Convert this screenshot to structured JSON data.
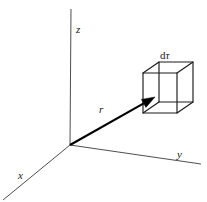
{
  "figure": {
    "background_color": "#ffffff",
    "line_color": "#3a3a3a",
    "vector_color": "#000000",
    "cube_color": "#1a1a1a",
    "width": 207,
    "height": 202
  },
  "axes": {
    "origin": {
      "x": 70,
      "y": 145
    },
    "items": [
      {
        "id": "z",
        "label": "z",
        "from": {
          "x": 71,
          "y": 9
        },
        "to": {
          "x": 70,
          "y": 145
        },
        "label_pos": {
          "x": 76,
          "y": 24
        }
      },
      {
        "id": "y",
        "label": "y",
        "from": {
          "x": 70,
          "y": 145
        },
        "to": {
          "x": 201,
          "y": 164
        },
        "label_pos": {
          "x": 177,
          "y": 149
        }
      },
      {
        "id": "x",
        "label": "x",
        "from": {
          "x": 70,
          "y": 145
        },
        "to": {
          "x": 3,
          "y": 200
        },
        "label_pos": {
          "x": 18,
          "y": 170
        }
      }
    ]
  },
  "vector": {
    "id": "r",
    "label": "r",
    "from": {
      "x": 70,
      "y": 145
    },
    "to": {
      "x": 155,
      "y": 97
    },
    "label_pos": {
      "x": 99,
      "y": 104
    },
    "has_arrowhead": true
  },
  "volume_element": {
    "id": "dtau",
    "label": "dτ",
    "label_prefix": "d",
    "label_symbol": "τ",
    "label_pos": {
      "x": 160,
      "y": 50
    },
    "front_face": [
      {
        "x": 143,
        "y": 73
      },
      {
        "x": 177,
        "y": 73
      },
      {
        "x": 177,
        "y": 113
      },
      {
        "x": 143,
        "y": 113
      }
    ],
    "back_face": [
      {
        "x": 159,
        "y": 62
      },
      {
        "x": 193,
        "y": 62
      },
      {
        "x": 193,
        "y": 102
      },
      {
        "x": 159,
        "y": 102
      }
    ],
    "attach_vertex": {
      "x": 155,
      "y": 97
    }
  }
}
